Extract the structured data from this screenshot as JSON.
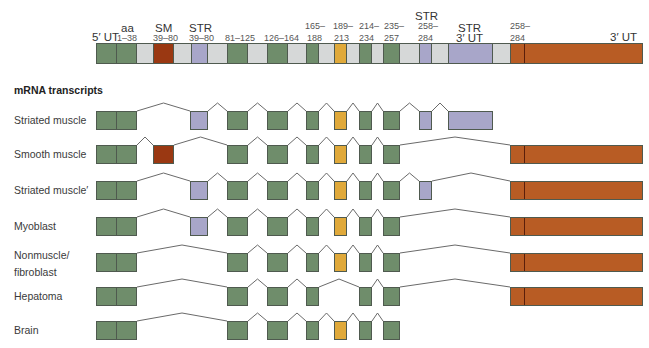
{
  "colors": {
    "green": "#6f8d6b",
    "grey": "#d6d8d8",
    "red": "#9a3812",
    "purple": "#a8a6c9",
    "yellow": "#e0a93a",
    "brown": "#b85c24",
    "line": "#6a6a6a"
  },
  "gene": {
    "labels": [
      {
        "id": "5ut",
        "text": "5′ UT",
        "x": 92,
        "y": 31,
        "size": "big"
      },
      {
        "id": "aa",
        "text": "aa",
        "x": 121,
        "y": 22,
        "size": "big"
      },
      {
        "id": "aa-range",
        "text": "1–38",
        "x": 117,
        "y": 33,
        "size": "small"
      },
      {
        "id": "sm",
        "text": "SM",
        "x": 155,
        "y": 22,
        "size": "big"
      },
      {
        "id": "sm-range",
        "text": "39–80",
        "x": 153,
        "y": 33,
        "size": "small"
      },
      {
        "id": "str1",
        "text": "STR",
        "x": 189,
        "y": 22,
        "size": "big"
      },
      {
        "id": "str1-range",
        "text": "39–80",
        "x": 189,
        "y": 33,
        "size": "small"
      },
      {
        "id": "r81",
        "text": "81–125",
        "x": 225,
        "y": 33,
        "size": "small"
      },
      {
        "id": "r126",
        "text": "126–164",
        "x": 264,
        "y": 33,
        "size": "small"
      },
      {
        "id": "r165a",
        "text": "165–",
        "x": 305,
        "y": 21,
        "size": "small"
      },
      {
        "id": "r165b",
        "text": "188",
        "x": 307,
        "y": 33,
        "size": "small"
      },
      {
        "id": "r189a",
        "text": "189–",
        "x": 333,
        "y": 21,
        "size": "small"
      },
      {
        "id": "r189b",
        "text": "213",
        "x": 334,
        "y": 33,
        "size": "small"
      },
      {
        "id": "r214a",
        "text": "214–",
        "x": 359,
        "y": 21,
        "size": "small"
      },
      {
        "id": "r214b",
        "text": "234",
        "x": 359,
        "y": 33,
        "size": "small"
      },
      {
        "id": "r235a",
        "text": "235–",
        "x": 384,
        "y": 21,
        "size": "small"
      },
      {
        "id": "r235b",
        "text": "257",
        "x": 384,
        "y": 33,
        "size": "small"
      },
      {
        "id": "str2",
        "text": "STR",
        "x": 415,
        "y": 10,
        "size": "big"
      },
      {
        "id": "r258a",
        "text": "258–",
        "x": 418,
        "y": 21,
        "size": "small"
      },
      {
        "id": "r258b",
        "text": "284",
        "x": 418,
        "y": 33,
        "size": "small"
      },
      {
        "id": "str3a",
        "text": "STR",
        "x": 458,
        "y": 22,
        "size": "big"
      },
      {
        "id": "str3b",
        "text": "3′ UT",
        "x": 456,
        "y": 32,
        "size": "big"
      },
      {
        "id": "r258c",
        "text": "258–",
        "x": 510,
        "y": 21,
        "size": "small"
      },
      {
        "id": "r258d",
        "text": "284",
        "x": 510,
        "y": 33,
        "size": "small"
      },
      {
        "id": "3ut",
        "text": "3′ UT",
        "x": 610,
        "y": 31,
        "size": "big"
      }
    ],
    "y": 43,
    "h": 21,
    "segments": [
      {
        "x": 96,
        "w": 20,
        "c": "green"
      },
      {
        "x": 116,
        "w": 20,
        "c": "green"
      },
      {
        "x": 136,
        "w": 17,
        "c": "grey"
      },
      {
        "x": 153,
        "w": 20,
        "c": "red"
      },
      {
        "x": 173,
        "w": 18,
        "c": "grey"
      },
      {
        "x": 191,
        "w": 16,
        "c": "purple"
      },
      {
        "x": 207,
        "w": 20,
        "c": "grey"
      },
      {
        "x": 227,
        "w": 20,
        "c": "green"
      },
      {
        "x": 247,
        "w": 20,
        "c": "grey"
      },
      {
        "x": 267,
        "w": 20,
        "c": "green"
      },
      {
        "x": 287,
        "w": 19,
        "c": "grey"
      },
      {
        "x": 306,
        "w": 12,
        "c": "green"
      },
      {
        "x": 318,
        "w": 16,
        "c": "grey"
      },
      {
        "x": 334,
        "w": 12,
        "c": "yellow"
      },
      {
        "x": 346,
        "w": 13,
        "c": "grey"
      },
      {
        "x": 359,
        "w": 12,
        "c": "green"
      },
      {
        "x": 371,
        "w": 12,
        "c": "grey"
      },
      {
        "x": 383,
        "w": 16,
        "c": "green"
      },
      {
        "x": 399,
        "w": 20,
        "c": "grey"
      },
      {
        "x": 419,
        "w": 12,
        "c": "purple"
      },
      {
        "x": 431,
        "w": 17,
        "c": "grey"
      },
      {
        "x": 448,
        "w": 44,
        "c": "purple"
      },
      {
        "x": 492,
        "w": 18,
        "c": "grey"
      },
      {
        "x": 510,
        "w": 132,
        "c": "brown",
        "divider": 13
      }
    ]
  },
  "section_title": "mRNA transcripts",
  "exon_defs": {
    "e5ut": {
      "x": 96,
      "w": 20,
      "c": "green"
    },
    "e1": {
      "x": 116,
      "w": 20,
      "c": "green"
    },
    "sm": {
      "x": 153,
      "w": 20,
      "c": "red"
    },
    "str": {
      "x": 190,
      "w": 17,
      "c": "purple"
    },
    "e81": {
      "x": 227,
      "w": 20,
      "c": "green"
    },
    "e126": {
      "x": 267,
      "w": 20,
      "c": "green"
    },
    "e165": {
      "x": 306,
      "w": 12,
      "c": "green"
    },
    "e189": {
      "x": 334,
      "w": 12,
      "c": "yellow"
    },
    "e214": {
      "x": 359,
      "w": 12,
      "c": "green"
    },
    "e235": {
      "x": 383,
      "w": 16,
      "c": "green"
    },
    "e258": {
      "x": 419,
      "w": 12,
      "c": "purple"
    },
    "str3": {
      "x": 448,
      "w": 44,
      "c": "purple"
    },
    "brown": {
      "x": 510,
      "w": 132,
      "c": "brown",
      "divider": 13
    }
  },
  "transcripts": [
    {
      "label": "Striated muscle",
      "label_lines": [
        "Striated muscle"
      ],
      "y": 111,
      "exons": [
        "e5ut",
        "e1",
        "str",
        "e81",
        "e126",
        "e165",
        "e189",
        "e214",
        "e235",
        "e258",
        "str3"
      ]
    },
    {
      "label": "Smooth muscle",
      "label_lines": [
        "Smooth muscle"
      ],
      "y": 145,
      "exons": [
        "e5ut",
        "e1",
        "sm",
        "e81",
        "e126",
        "e165",
        "e189",
        "e214",
        "e235",
        "brown"
      ]
    },
    {
      "label": "Striated muscle′",
      "label_lines": [
        "Striated muscle′"
      ],
      "y": 181,
      "exons": [
        "e5ut",
        "e1",
        "str",
        "e81",
        "e126",
        "e165",
        "e189",
        "e214",
        "e235",
        "e258",
        "brown"
      ]
    },
    {
      "label": "Myoblast",
      "label_lines": [
        "Myoblast"
      ],
      "y": 217,
      "exons": [
        "e5ut",
        "e1",
        "str",
        "e81",
        "e126",
        "e165",
        "e189",
        "e214",
        "e235",
        "brown"
      ]
    },
    {
      "label": "Nonmuscle/ fibroblast",
      "label_lines": [
        "Nonmuscle/",
        "fibroblast"
      ],
      "y": 253,
      "exons": [
        "e5ut",
        "e1",
        "e81",
        "e126",
        "e165",
        "e189",
        "e214",
        "e235",
        "brown"
      ]
    },
    {
      "label": "Hepatoma",
      "label_lines": [
        "Hepatoma"
      ],
      "y": 287,
      "exons": [
        "e5ut",
        "e1",
        "e81",
        "e126",
        "e165",
        "e214",
        "e235",
        "brown"
      ]
    },
    {
      "label": "Brain",
      "label_lines": [
        "Brain"
      ],
      "y": 321,
      "exons": [
        "e5ut",
        "e1",
        "e81",
        "e126",
        "e165",
        "e189",
        "e214",
        "e235"
      ]
    }
  ],
  "exon_height": 19
}
